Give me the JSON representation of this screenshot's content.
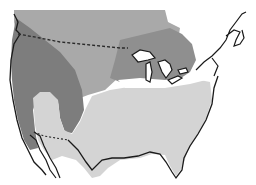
{
  "map": {
    "type": "range-map",
    "region": "North America (United States and southern Canada)",
    "labels": [],
    "colors": {
      "background": "#ffffff",
      "northern_zone": "#a9a9a9",
      "western_zone": "#7d7d7d",
      "southern_zone": "#d4d4d4",
      "outline": "#1a1a1a",
      "border_dash": "#2a2a2a"
    },
    "zones": [
      {
        "id": "northern",
        "shade": "medium gray",
        "area": "southern Canada / northern plains"
      },
      {
        "id": "western",
        "shade": "dark gray",
        "area": "western United States and Pacific coast"
      },
      {
        "id": "southern",
        "shade": "light gray",
        "area": "central, southern and eastern United States"
      }
    ],
    "borders": [
      {
        "id": "us-canada",
        "style": "dashed"
      },
      {
        "id": "us-mexico",
        "style": "dashed"
      }
    ]
  }
}
